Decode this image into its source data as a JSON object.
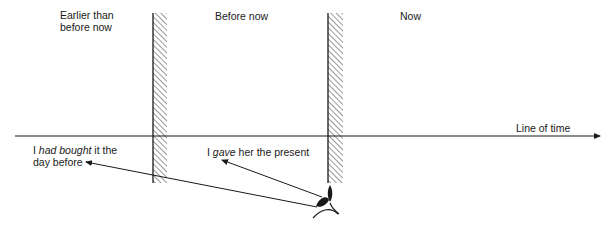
{
  "diagram": {
    "zones": [
      {
        "id": "earlier",
        "label_line1": "Earlier than",
        "label_line2": "before now"
      },
      {
        "id": "before",
        "label": "Before now"
      },
      {
        "id": "now",
        "label": "Now"
      }
    ],
    "timeline": {
      "label": "Line of time"
    },
    "sentences": {
      "past_perfect": {
        "prefix": "I ",
        "verb": "had bought",
        "suffix": " it the",
        "line2": "day before"
      },
      "past_simple": {
        "prefix": "I ",
        "verb": "gave",
        "suffix": " her the present"
      }
    },
    "observer": {
      "icon": "eye-icon"
    },
    "colors": {
      "ink": "#1a1a1a",
      "background": "#ffffff"
    }
  }
}
